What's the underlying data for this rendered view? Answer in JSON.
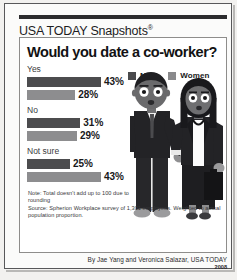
{
  "brand": {
    "title": "USA TODAY Snapshots",
    "registered_mark": "®"
  },
  "chart_data": {
    "type": "bar",
    "orientation": "horizontal",
    "title": "Would you date a co-worker?",
    "categories": [
      "Yes",
      "No",
      "Not sure"
    ],
    "series": [
      {
        "name": "Men",
        "color": "#4c4c4e",
        "values": [
          43,
          31,
          25
        ],
        "labels": [
          "43%",
          "31%",
          "25%"
        ]
      },
      {
        "name": "Women",
        "color": "#8d8d8f",
        "values": [
          28,
          29,
          43
        ],
        "labels": [
          "28%",
          "29%",
          "43%"
        ]
      }
    ],
    "xlabel": "",
    "ylabel": "",
    "xlim": [
      0,
      50
    ],
    "grid": false,
    "legend_position": "top-right",
    "value_label_suffix": "%",
    "annotations": [
      "Note: Total doesn't add up to 100 due to rounding",
      "Source: Spherion Workplace survey of 1,301 employees. Weighted to actual population proportion."
    ]
  },
  "legend": {
    "men_label": "Men",
    "women_label": "Women"
  },
  "groups": [
    {
      "label": "Yes",
      "men_value": "43%",
      "men_width": 43,
      "women_value": "28%",
      "women_width": 28
    },
    {
      "label": "No",
      "men_value": "31%",
      "men_width": 31,
      "women_value": "29%",
      "women_width": 29
    },
    {
      "label": "Not sure",
      "men_value": "25%",
      "men_width": 25,
      "women_value": "43%",
      "women_width": 43
    }
  ],
  "footnotes": {
    "note": "Note: Total doesn't add up to 100 due to rounding",
    "source": "Source: Spherion Workplace survey of 1,301 employees. Weighted to actual population proportion."
  },
  "byline": {
    "credit": "By Jae Yang and Veronica Salazar, USA TODAY",
    "year": "2008"
  },
  "colors": {
    "men_bar": "#4c4c4e",
    "women_bar": "#8d8d8f",
    "frame": "#58585a",
    "text": "#18181a"
  }
}
